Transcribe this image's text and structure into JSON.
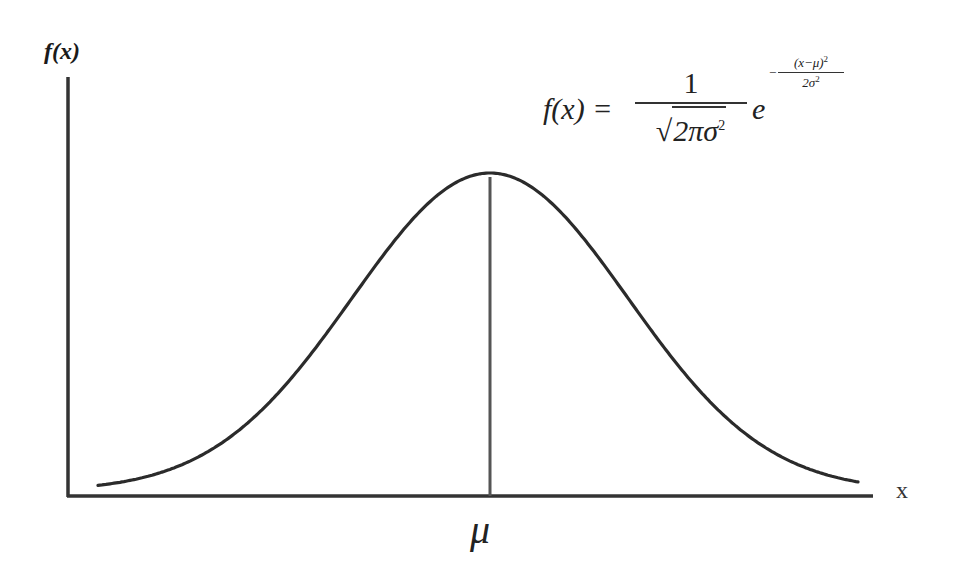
{
  "diagram": {
    "y_axis_label": "f(x)",
    "x_axis_label": "x",
    "mean_label": "μ",
    "formula": {
      "lhs": "f(x) = ",
      "numerator": "1",
      "denominator_radicand": "2πσ",
      "denominator_power": "2",
      "base": "e",
      "exponent_sign": "−",
      "exponent_numerator": "(x−μ)",
      "exponent_numerator_power": "2",
      "exponent_denominator": "2σ",
      "exponent_denominator_power": "2",
      "plain_text": "f(x) = 1/√(2πσ²) e^(−(x−μ)²/(2σ²))"
    },
    "colors": {
      "background": "#ffffff",
      "curve": "#2b2b2b",
      "axes": "#333333",
      "mean_line": "#555555"
    }
  },
  "chart_data": {
    "type": "line",
    "title": "",
    "xlabel": "x",
    "ylabel": "f(x)",
    "grid": false,
    "legend": null,
    "series": [
      {
        "name": "Gaussian (bell curve)",
        "function": "normal_pdf",
        "mean_label": "μ",
        "x_range_in_sigma": [
          -2.8,
          2.7
        ],
        "peak_at": "μ"
      }
    ],
    "annotations": [
      {
        "type": "vertical_line",
        "at": "μ",
        "from": "x-axis",
        "to": "peak"
      },
      {
        "type": "text",
        "text": "μ",
        "position": "below x-axis at mean"
      },
      {
        "type": "formula",
        "text": "f(x) = 1/√(2πσ²) e^(−(x−μ)²/(2σ²))",
        "position": "top-right"
      }
    ],
    "geometry_px": {
      "axis_origin": [
        68,
        496
      ],
      "y_axis_top": 77,
      "x_axis_right": 873,
      "mean_x": 490,
      "peak_y": 177,
      "sigma_px": 138,
      "curve_x_start": 98,
      "curve_x_end": 858
    }
  }
}
